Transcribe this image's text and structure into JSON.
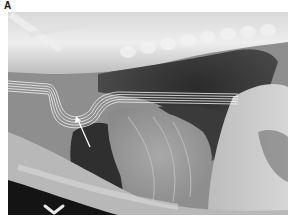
{
  "figure": {
    "panel_label": "A",
    "image_type": "lateral thoracic radiograph",
    "annotations": [
      {
        "type": "arrow",
        "color": "#ffffff",
        "description": "arrow pointing to tube bend"
      },
      {
        "type": "chevron-marker",
        "color": "#ffffff",
        "description": "ventral chevron marker bottom-left"
      }
    ],
    "colors": {
      "background": "#ffffff",
      "bone": "#e6e6e6",
      "soft_tissue": "#8c8c8c",
      "lung": "#2e2e2e",
      "tube": "#f2f2f2"
    }
  }
}
